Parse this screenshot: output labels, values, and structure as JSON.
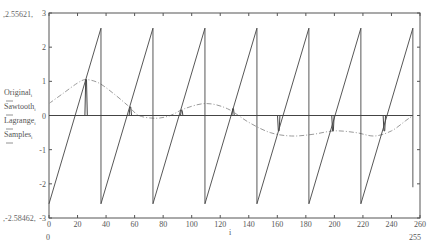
{
  "chart_data": {
    "type": "line",
    "title": "",
    "xlabel": "i",
    "ylabel": "",
    "xlim": [
      0,
      260
    ],
    "ylim": [
      -3,
      3
    ],
    "x_ticks": [
      0,
      20,
      40,
      60,
      80,
      100,
      120,
      140,
      160,
      180,
      200,
      220,
      240,
      260
    ],
    "y_ticks": [
      -3,
      -2,
      -1,
      0,
      1,
      2,
      3
    ],
    "x_range_labels": {
      "min": "0",
      "max": "255"
    },
    "y_range_labels": {
      "max": "2.55621",
      "min": "-2.58462"
    },
    "grid": false,
    "legend_position": "left of y-axis",
    "series": [
      {
        "name": "Original",
        "label": "Original",
        "subscript": "i",
        "style": "dashed",
        "color": "#9a9a9a",
        "points": [
          [
            0,
            0.35
          ],
          [
            10,
            0.65
          ],
          [
            20,
            0.95
          ],
          [
            26,
            1.05
          ],
          [
            35,
            0.95
          ],
          [
            45,
            0.65
          ],
          [
            55,
            0.3
          ],
          [
            63,
            0.0
          ],
          [
            75,
            -0.08
          ],
          [
            85,
            0.0
          ],
          [
            95,
            0.2
          ],
          [
            110,
            0.35
          ],
          [
            125,
            0.2
          ],
          [
            140,
            -0.2
          ],
          [
            155,
            -0.5
          ],
          [
            170,
            -0.6
          ],
          [
            185,
            -0.55
          ],
          [
            200,
            -0.45
          ],
          [
            215,
            -0.5
          ],
          [
            228,
            -0.6
          ],
          [
            240,
            -0.45
          ],
          [
            250,
            -0.15
          ],
          [
            255,
            0.0
          ]
        ]
      },
      {
        "name": "Sawtooth",
        "label": "Sawtooth",
        "subscript": "i",
        "style": "solid",
        "color": "#444444",
        "min": -2.58462,
        "max": 2.55621,
        "periods": 7,
        "x_end": 255
      },
      {
        "name": "Lagrange",
        "label": "Lagrange",
        "subscript": "i",
        "style": "solid",
        "color": "#444444",
        "points": [
          [
            0,
            0
          ],
          [
            255,
            0
          ]
        ]
      },
      {
        "name": "Samples",
        "label": "Samples",
        "subscript": "i",
        "style": "spikes",
        "color": "#444444",
        "spikes": [
          [
            26,
            1.05
          ],
          [
            57,
            0.25
          ],
          [
            93,
            0.15
          ],
          [
            129,
            0.2
          ],
          [
            161,
            -0.45
          ],
          [
            199,
            -0.45
          ],
          [
            235,
            -0.45
          ]
        ]
      }
    ]
  }
}
